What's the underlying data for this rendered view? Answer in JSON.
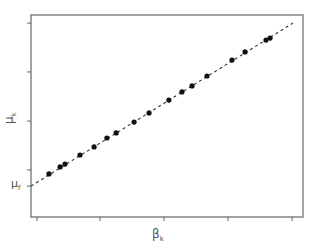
{
  "chart_data": {
    "type": "scatter",
    "title": "",
    "xlabel": "β",
    "xlabel_sub": "k",
    "ylabel": "μ",
    "ylabel_sub": "k",
    "y_annotation": "μ",
    "y_annotation_sub": "f",
    "units": "normalized (0-1 of plot area); no numeric tick labels shown",
    "xlim": [
      0,
      1
    ],
    "ylim": [
      0,
      1
    ],
    "grid": false,
    "legend": null,
    "x_ticks": [
      0.022,
      0.254,
      0.489,
      0.724,
      0.96
    ],
    "y_ticks": [
      0.153,
      0.233,
      0.475,
      0.718,
      0.96
    ],
    "y_annotation_value": 0.153,
    "series": [
      {
        "name": "data",
        "style": "markers",
        "marker": "filled-circle",
        "color": "#111111",
        "x": [
          0.066,
          0.107,
          0.125,
          0.18,
          0.232,
          0.279,
          0.313,
          0.379,
          0.434,
          0.507,
          0.555,
          0.592,
          0.647,
          0.739,
          0.787,
          0.864,
          0.879
        ],
        "y": [
          0.213,
          0.248,
          0.262,
          0.307,
          0.347,
          0.391,
          0.416,
          0.47,
          0.515,
          0.579,
          0.619,
          0.649,
          0.698,
          0.777,
          0.817,
          0.876,
          0.886
        ]
      },
      {
        "name": "fit",
        "style": "dashed-line",
        "color": "#333333",
        "x": [
          0.0,
          0.963
        ],
        "y": [
          0.153,
          0.96
        ]
      }
    ]
  },
  "plot": {
    "frame_color": "#666666",
    "left": 31,
    "top": 15,
    "right": 303,
    "bottom": 217
  }
}
